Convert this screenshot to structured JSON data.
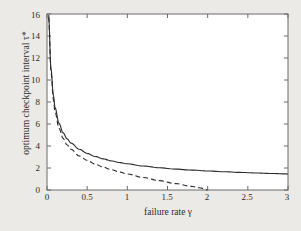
{
  "chart_data": {
    "type": "line",
    "title": "",
    "xlabel": "failure rate γ",
    "ylabel": "optimum checkpoint interval τ*",
    "xlim": [
      0,
      3
    ],
    "ylim": [
      0,
      16
    ],
    "xticks": [
      "0",
      "0.5",
      "1",
      "1.5",
      "2",
      "2.5",
      "3"
    ],
    "xtick_values": [
      0,
      0.5,
      1,
      1.5,
      2,
      2.5,
      3
    ],
    "yticks": [
      "0",
      "2",
      "4",
      "6",
      "8",
      "10",
      "12",
      "14",
      "16"
    ],
    "ytick_values": [
      0,
      2,
      4,
      6,
      8,
      10,
      12,
      14,
      16
    ],
    "grid": false,
    "legend_position": "upper right",
    "series": [
      {
        "name": "τ*Chandy",
        "style": "solid",
        "color": "#2b2b2b",
        "x": [
          0.02,
          0.05,
          0.08,
          0.1,
          0.15,
          0.2,
          0.25,
          0.3,
          0.4,
          0.5,
          0.6,
          0.7,
          0.8,
          0.9,
          1.0,
          1.2,
          1.4,
          1.6,
          1.8,
          2.0,
          2.2,
          2.4,
          2.6,
          2.8,
          3.0
        ],
        "y": [
          15.9,
          11.0,
          8.6,
          7.5,
          6.05,
          5.2,
          4.66,
          4.26,
          3.71,
          3.33,
          3.05,
          2.83,
          2.65,
          2.5,
          2.38,
          2.18,
          2.02,
          1.9,
          1.81,
          1.73,
          1.66,
          1.6,
          1.55,
          1.5,
          1.46
        ]
      },
      {
        "name": "τ*Tantawi",
        "style": "dashed",
        "color": "#2b2b2b",
        "x": [
          0.02,
          0.05,
          0.08,
          0.1,
          0.15,
          0.2,
          0.25,
          0.3,
          0.4,
          0.5,
          0.6,
          0.7,
          0.8,
          0.9,
          1.0,
          1.2,
          1.4,
          1.6,
          1.8,
          1.9,
          2.0
        ],
        "y": [
          15.7,
          10.7,
          8.2,
          7.1,
          5.6,
          4.7,
          4.1,
          3.7,
          3.1,
          2.7,
          2.35,
          2.08,
          1.85,
          1.64,
          1.46,
          1.13,
          0.85,
          0.58,
          0.33,
          0.2,
          0.0
        ]
      }
    ]
  },
  "legend": {
    "entries": [
      {
        "label_base": "τ",
        "label_sup": "*",
        "label_rest": "Chandy",
        "style": "solid"
      },
      {
        "label_base": "τ",
        "label_sup": "*",
        "label_rest": "Tantawi",
        "style": "dashed"
      }
    ]
  },
  "colors": {
    "background": "#eceae7",
    "plot_background": "#ffffff",
    "axis": "#5a5a5a",
    "line": "#2b2b2b",
    "text": "#2b2b2b"
  }
}
